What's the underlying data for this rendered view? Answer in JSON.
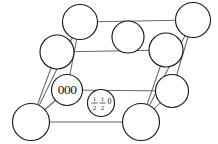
{
  "figure": {
    "background_color": "#ffffff",
    "atom_outline_color": "#1b1b1b",
    "edge_color": "#6a6a6a",
    "label_color": "#111111"
  },
  "labels": {
    "origin": "000",
    "face_center": {
      "first_numerator": "1",
      "first_denominator": "2",
      "second_numerator": "1",
      "second_denominator": "2",
      "third": "0"
    }
  },
  "atoms": [
    {
      "id": "atom-top-back-left",
      "cx": 80,
      "cy": 22,
      "r": 17.5
    },
    {
      "id": "atom-top-back-right",
      "cx": 193,
      "cy": 20,
      "r": 17.5
    },
    {
      "id": "atom-top-interior",
      "cx": 128,
      "cy": 37,
      "r": 16.0
    },
    {
      "id": "atom-mid-left",
      "cx": 57,
      "cy": 52,
      "r": 17.0
    },
    {
      "id": "atom-mid-right",
      "cx": 166,
      "cy": 50,
      "r": 17.0
    },
    {
      "id": "atom-origin",
      "cx": 67,
      "cy": 90,
      "r": 15.5
    },
    {
      "id": "atom-right-lower",
      "cx": 172,
      "cy": 91,
      "r": 16.5
    },
    {
      "id": "atom-front-left",
      "cx": 31,
      "cy": 122,
      "r": 18.5
    },
    {
      "id": "atom-front-right",
      "cx": 141,
      "cy": 122,
      "r": 18.5
    },
    {
      "id": "atom-face-center",
      "cx": 101,
      "cy": 103,
      "r": 13.5
    }
  ],
  "edges": [
    {
      "id": "edge-top-back",
      "x1": 80,
      "y1": 22,
      "x2": 193,
      "y2": 20
    },
    {
      "id": "edge-mid-back",
      "x1": 57,
      "y1": 52,
      "x2": 166,
      "y2": 50
    },
    {
      "id": "edge-mid-front",
      "x1": 67,
      "y1": 90,
      "x2": 172,
      "y2": 91
    },
    {
      "id": "edge-front-base",
      "x1": 31,
      "y1": 122,
      "x2": 141,
      "y2": 122
    },
    {
      "id": "edge-left-upper",
      "x1": 80,
      "y1": 22,
      "x2": 31,
      "y2": 122
    },
    {
      "id": "edge-left-lower",
      "x1": 57,
      "y1": 52,
      "x2": 31,
      "y2": 122
    },
    {
      "id": "edge-left-diag",
      "x1": 80,
      "y1": 22,
      "x2": 67,
      "y2": 90
    },
    {
      "id": "edge-right-upper",
      "x1": 193,
      "y1": 20,
      "x2": 141,
      "y2": 122
    },
    {
      "id": "edge-right-lower",
      "x1": 166,
      "y1": 50,
      "x2": 141,
      "y2": 122
    },
    {
      "id": "edge-right-diag",
      "x1": 193,
      "y1": 20,
      "x2": 172,
      "y2": 91
    },
    {
      "id": "edge-origin-link",
      "x1": 67,
      "y1": 90,
      "x2": 31,
      "y2": 122
    },
    {
      "id": "edge-rlow-link",
      "x1": 172,
      "y1": 91,
      "x2": 141,
      "y2": 122
    }
  ]
}
